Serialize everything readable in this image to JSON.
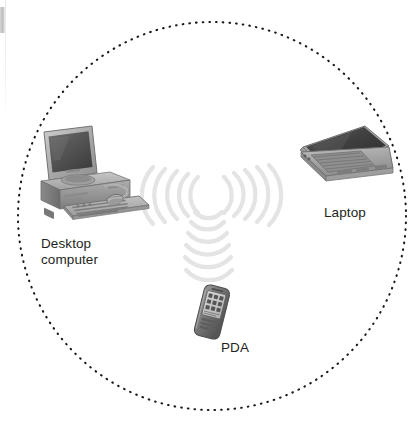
{
  "diagram": {
    "type": "wireless-network-topology",
    "background_color": "#ffffff",
    "boundary": {
      "name": "wireless-coverage-circle",
      "style": "dotted",
      "color": "#1a1a1a",
      "center_x": 212,
      "center_y": 216,
      "radius": 194
    },
    "signal_color": "#e3e3e3",
    "label_color": "#231f20",
    "nodes": [
      {
        "id": "desktop",
        "label": "Desktop\ncomputer",
        "icon": "desktop-computer-icon",
        "x": 90,
        "y": 170
      },
      {
        "id": "laptop",
        "label": "Laptop",
        "icon": "laptop-icon",
        "x": 343,
        "y": 165
      },
      {
        "id": "pda",
        "label": "PDA",
        "icon": "pda-icon",
        "x": 212,
        "y": 312
      }
    ],
    "signals": [
      {
        "id": "signal-desktop",
        "name": "wireless-signal-desktop",
        "direction": "left",
        "arcs": 5
      },
      {
        "id": "signal-laptop",
        "name": "wireless-signal-laptop",
        "direction": "right",
        "arcs": 5
      },
      {
        "id": "signal-pda",
        "name": "wireless-signal-pda",
        "direction": "down",
        "arcs": 6
      }
    ]
  }
}
